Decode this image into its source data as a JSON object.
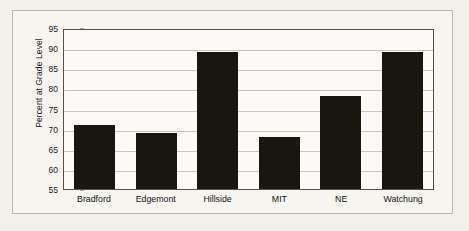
{
  "chart_data": {
    "type": "bar",
    "title": "",
    "xlabel": "",
    "ylabel": "Percent at Grade Level",
    "categories": [
      "Bradford",
      "Edgemont",
      "Hillside",
      "MIT",
      "NE",
      "Watchung"
    ],
    "values": [
      71,
      69,
      89,
      68,
      78,
      89
    ],
    "ylim": [
      55,
      95
    ],
    "ytick_step": 5,
    "yticks": [
      95,
      90,
      85,
      80,
      75,
      70,
      65,
      60,
      55
    ],
    "ytick_labels": [
      "95",
      "90",
      "85",
      "80",
      "75",
      "70",
      "65",
      "60",
      "55"
    ],
    "grid": true,
    "legend": false,
    "legend_position": "none",
    "bar_color": "#19160f",
    "plot_background": "#fbfaf6",
    "gridline_color": "#c9c6c0",
    "axis_color": "#55524d",
    "page_background": "#f2f0eb",
    "frame_color": "#b9b6ae"
  }
}
